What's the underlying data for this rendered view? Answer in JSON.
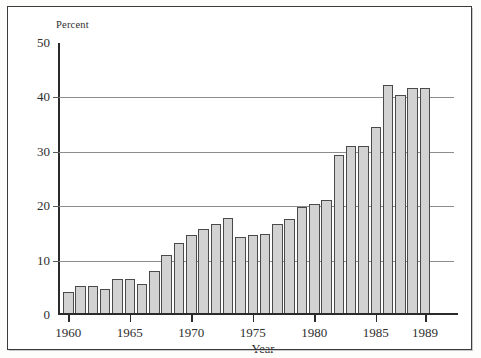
{
  "chart_data": {
    "type": "bar",
    "title": "",
    "xlabel": "Year",
    "ylabel": "Percent",
    "ylim": [
      0,
      50
    ],
    "ytick_labels": [
      "50",
      "40",
      "30",
      "20",
      "10",
      "0"
    ],
    "ytick_values": [
      50,
      40,
      30,
      20,
      10,
      0
    ],
    "grid": true,
    "gridlines_at": [
      40,
      30,
      20,
      10
    ],
    "legend": "none",
    "xtick_labels": [
      "1960",
      "1965",
      "1970",
      "1975",
      "1980",
      "1985",
      "1989"
    ],
    "xtick_values": [
      1960,
      1965,
      1970,
      1975,
      1980,
      1985,
      1989
    ],
    "categories": [
      1960,
      1961,
      1962,
      1963,
      1964,
      1965,
      1966,
      1967,
      1968,
      1969,
      1970,
      1971,
      1972,
      1973,
      1974,
      1975,
      1976,
      1977,
      1978,
      1979,
      1980,
      1981,
      1982,
      1983,
      1984,
      1985,
      1986,
      1987,
      1988,
      1989
    ],
    "values": [
      3.8,
      5.0,
      4.9,
      4.4,
      6.2,
      6.3,
      5.4,
      7.7,
      10.7,
      12.8,
      14.3,
      15.4,
      16.4,
      17.4,
      13.9,
      14.3,
      14.5,
      16.4,
      17.2,
      19.4,
      20.0,
      20.7,
      29.0,
      30.7,
      30.7,
      34.2,
      42.0,
      40.0,
      41.3,
      41.3
    ],
    "bar_fill": "#d2d2d2",
    "bar_stroke": "#4a4a4a",
    "axis_color": "#2b2b2b",
    "grid_color": "#8d8d8d"
  }
}
